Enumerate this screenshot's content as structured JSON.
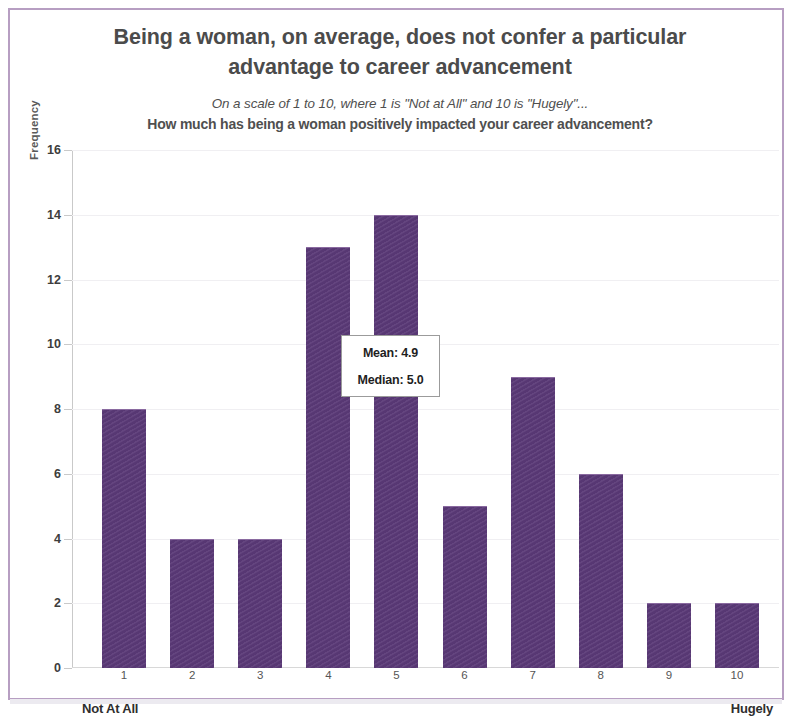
{
  "title": "Being a woman, on average, does not confer a particular advantage to career advancement",
  "subtitle_line1": "On a scale of 1 to 10, where 1 is \"Not at All\" and 10 is \"Hugely\"...",
  "subtitle_line2": "How much has being a woman positively impacted your career advancement?",
  "stats": {
    "mean_label": "Mean: 4.9",
    "median_label": "Median: 5.0"
  },
  "anchors": {
    "left": "Not At All",
    "right": "Hugely"
  },
  "colors": {
    "bar": "#5b3a78",
    "title_text": "#4b4b4b",
    "frame": "#b79ec2"
  },
  "chart_data": {
    "type": "bar",
    "title": "Being a woman, on average, does not confer a particular advantage to career advancement",
    "subtitle": "On a scale of 1 to 10, where 1 is \"Not at All\" and 10 is \"Hugely\"... How much has being a woman positively impacted your career advancement?",
    "xlabel": "",
    "ylabel": "Frequency",
    "categories": [
      "1",
      "2",
      "3",
      "4",
      "5",
      "6",
      "7",
      "8",
      "9",
      "10"
    ],
    "values": [
      8,
      4,
      4,
      13,
      14,
      5,
      9,
      6,
      2,
      2
    ],
    "ylim": [
      0,
      16
    ],
    "yticks": [
      0,
      2,
      4,
      6,
      8,
      10,
      12,
      14,
      16
    ],
    "grid": true,
    "legend": false,
    "annotations": [
      "Mean: 4.9",
      "Median: 5.0"
    ],
    "axis_anchor_low": "Not At All",
    "axis_anchor_high": "Hugely",
    "mean": 4.9,
    "median": 5.0
  }
}
